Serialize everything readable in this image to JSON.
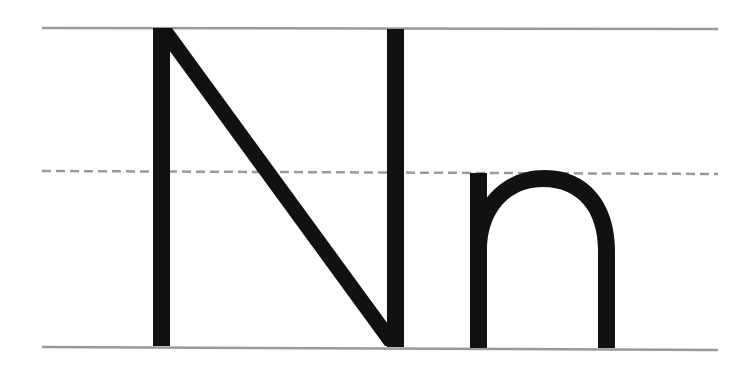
{
  "worksheet": {
    "letters": [
      "N",
      "n"
    ],
    "uppercase": "N",
    "lowercase": "n",
    "colors": {
      "background": "#ffffff",
      "glyph": "#111111",
      "guide_line": "#9a9a9a"
    },
    "guide_lines": [
      "top-line",
      "midline-dashed",
      "baseline"
    ]
  }
}
